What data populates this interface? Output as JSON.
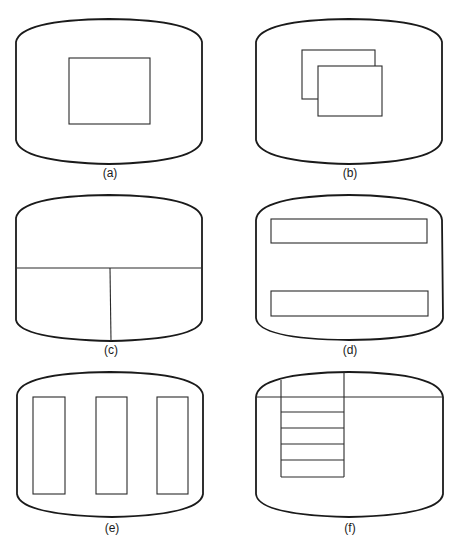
{
  "figure": {
    "panels": [
      {
        "id": "a",
        "label": "(a)",
        "layout": "single-window"
      },
      {
        "id": "b",
        "label": "(b)",
        "layout": "overlapping-windows"
      },
      {
        "id": "c",
        "label": "(c)",
        "layout": "tiled-split"
      },
      {
        "id": "d",
        "label": "(d)",
        "layout": "horizontal-strips"
      },
      {
        "id": "e",
        "label": "(e)",
        "layout": "vertical-columns"
      },
      {
        "id": "f",
        "label": "(f)",
        "layout": "menu-bar-dropdown"
      }
    ]
  },
  "colors": {
    "stroke": "#1a1a1a",
    "background": "#ffffff"
  }
}
